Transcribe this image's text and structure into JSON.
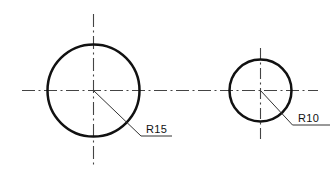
{
  "drawing": {
    "title": "Two Circles With Radius Dimensions",
    "background_color": "#ffffff",
    "line_color": "#111111",
    "centerline_color": "#555555",
    "entities": {
      "circle_large": {
        "name": "large-circle",
        "center_x": 93,
        "center_y": 90,
        "radius": 46,
        "stroke_width": 2.4,
        "dimension_label": "R15"
      },
      "circle_small": {
        "name": "small-circle",
        "center_x": 260,
        "center_y": 90,
        "radius": 31,
        "stroke_width": 2.4,
        "dimension_label": "R10"
      }
    },
    "centerlines": {
      "horizontal": {
        "y": 90,
        "x_start": 22,
        "x_end": 318,
        "dash_pattern": "12,3,2,3"
      },
      "vertical_large": {
        "x": 93,
        "y_start": 14,
        "y_end": 166,
        "dash_pattern": "12,3,2,3"
      },
      "vertical_small": {
        "x": 260,
        "y_start": 48,
        "y_end": 140,
        "dash_pattern": "10,3,2,3"
      }
    },
    "leaders": {
      "large": {
        "from_x": 93,
        "from_y": 90,
        "to_x": 141,
        "to_y": 136,
        "shoulder_x": 172,
        "shoulder_y": 136,
        "text_x": 145,
        "text_y": 133
      },
      "small": {
        "from_x": 260,
        "from_y": 90,
        "to_x": 292,
        "to_y": 125,
        "shoulder_x": 328,
        "shoulder_y": 125,
        "text_x": 297,
        "text_y": 122
      }
    }
  },
  "labels": {
    "radius_large": "R15",
    "radius_small": "R10"
  }
}
